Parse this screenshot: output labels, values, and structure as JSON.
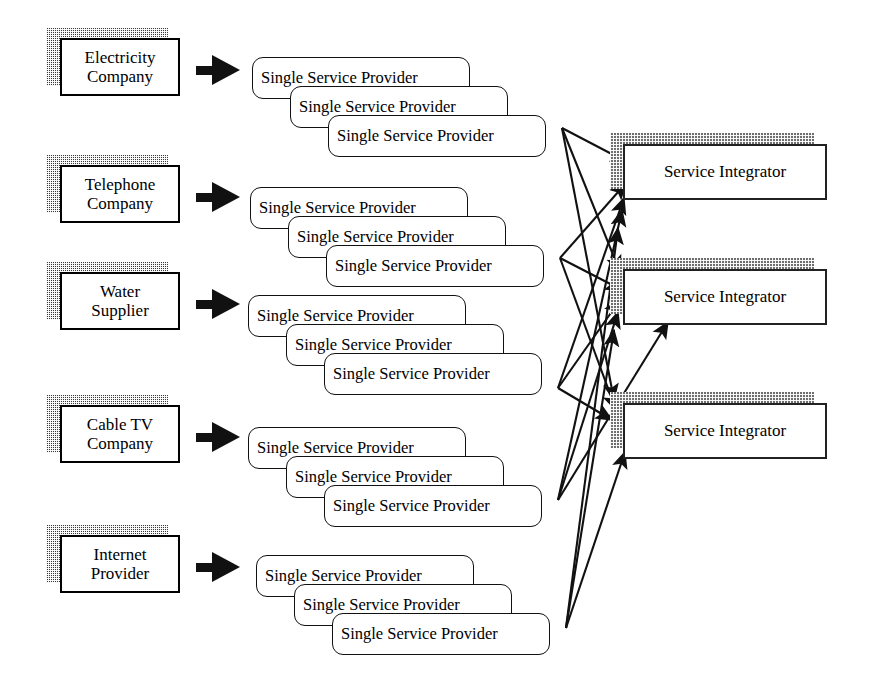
{
  "diagram": {
    "stroke_color": "#111111",
    "shadow_color": "#3a3a3a",
    "background": "#ffffff",
    "sources": [
      {
        "id": "electricity",
        "line1": "Electricity",
        "line2": "Company"
      },
      {
        "id": "telephone",
        "line1": "Telephone",
        "line2": "Company"
      },
      {
        "id": "water",
        "line1": "Water",
        "line2": "Supplier"
      },
      {
        "id": "cabletv",
        "line1": "Cable TV",
        "line2": "Company"
      },
      {
        "id": "internet",
        "line1": "Internet",
        "line2": "Provider"
      }
    ],
    "arrow_icon": "right-block-arrow",
    "provider_label": "Single Service Provider",
    "providers_per_stack": 3,
    "stacks": [
      {
        "id": "stack-electricity",
        "labels": [
          "Single Service Provider",
          "Single Service Provider",
          "Single Service Provider"
        ]
      },
      {
        "id": "stack-telephone",
        "labels": [
          "Single Service Provider",
          "Single Service Provider",
          "Single Service Provider"
        ]
      },
      {
        "id": "stack-water",
        "labels": [
          "Single Service Provider",
          "Single Service Provider",
          "Single Service Provider"
        ]
      },
      {
        "id": "stack-cabletv",
        "labels": [
          "Single Service Provider",
          "Single Service Provider",
          "Single Service Provider"
        ]
      },
      {
        "id": "stack-internet",
        "labels": [
          "Single Service Provider",
          "Single Service Provider",
          "Single Service Provider"
        ]
      }
    ],
    "integrators": [
      {
        "id": "integrator-1",
        "label": "Service Integrator"
      },
      {
        "id": "integrator-2",
        "label": "Service Integrator"
      },
      {
        "id": "integrator-3",
        "label": "Service Integrator"
      }
    ]
  }
}
